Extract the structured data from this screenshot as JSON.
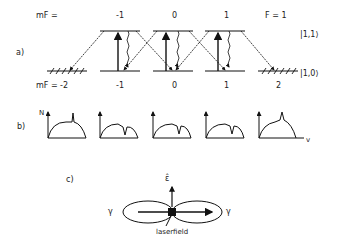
{
  "panel_a": {
    "label": "a)",
    "mf_top_label": "mF =",
    "mf_bottom_label": "mF =",
    "upper_mf": [
      "-1",
      "0",
      "1"
    ],
    "lower_mf": [
      "-2",
      "-1",
      "0",
      "1",
      "2"
    ],
    "F_label": "F = 1",
    "upper_state": "|1,1⟩",
    "lower_state": "|1,0⟩"
  },
  "panel_b": {
    "label": "b)",
    "y_axis": "N",
    "x_axis": "v",
    "profiles": [
      {
        "feature": "peak",
        "position": 0.7
      },
      {
        "feature": "dip",
        "position": 0.65
      },
      {
        "feature": "dip",
        "position": 0.7
      },
      {
        "feature": "dip",
        "position": 0.7
      },
      {
        "feature": "peak",
        "position": 0.6
      }
    ]
  },
  "panel_c": {
    "label": "c)",
    "polarization": "ε̂",
    "gamma_left": "γ",
    "gamma_right": "γ",
    "caption": "laserfield"
  }
}
